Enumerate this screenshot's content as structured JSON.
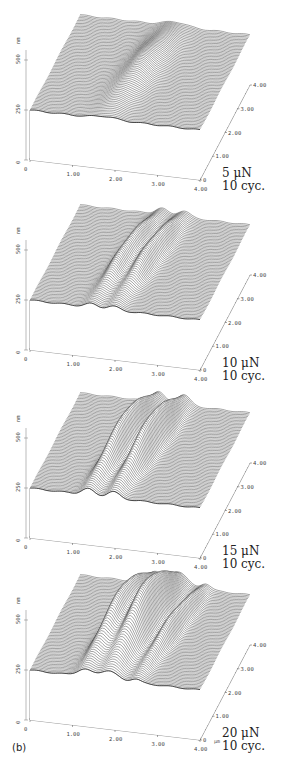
{
  "figure_label": "(b)",
  "unit_um": "μm",
  "panels": [
    {
      "force": "5 μN",
      "cycles": "10 cyc.",
      "top": 10,
      "ridges": [
        {
          "pos": 0.5,
          "amp": 14,
          "width": 0.09
        }
      ]
    },
    {
      "force": "10 μN",
      "cycles": "10 cyc.",
      "top": 200,
      "ridges": [
        {
          "pos": 0.42,
          "amp": 20,
          "width": 0.05
        },
        {
          "pos": 0.55,
          "amp": 20,
          "width": 0.05
        }
      ]
    },
    {
      "force": "15 μN",
      "cycles": "10 cyc.",
      "top": 388,
      "ridges": [
        {
          "pos": 0.4,
          "amp": 34,
          "width": 0.05
        },
        {
          "pos": 0.55,
          "amp": 34,
          "width": 0.05
        }
      ]
    },
    {
      "force": "20 μN",
      "cycles": "10 cyc.",
      "top": 570,
      "ridges": [
        {
          "pos": 0.38,
          "amp": 40,
          "width": 0.06
        },
        {
          "pos": 0.52,
          "amp": 48,
          "width": 0.07
        },
        {
          "pos": 0.68,
          "amp": 20,
          "width": 0.04
        }
      ]
    }
  ],
  "chart_data": {
    "type": "surface",
    "x_axis": {
      "ticks": [
        "0",
        "1.00",
        "2.00",
        "3.00",
        "4.00"
      ],
      "unit": "μm"
    },
    "y_axis": {
      "ticks": [
        "0",
        "1.00",
        "2.00",
        "3.00",
        "4.00"
      ],
      "unit": "μm"
    },
    "z_axis": {
      "ticks": [
        "0",
        "250",
        "500"
      ],
      "unit": "nm"
    },
    "series": [
      {
        "name": "5 μN, 10 cyc.",
        "description": "single small wear mound near center"
      },
      {
        "name": "10 μN, 10 cyc.",
        "description": "two narrow parallel ridges"
      },
      {
        "name": "15 μN, 10 cyc.",
        "description": "two pronounced parallel ridges"
      },
      {
        "name": "20 μN, 10 cyc.",
        "description": "large multi-ridge pile-up, tallest features"
      }
    ]
  }
}
